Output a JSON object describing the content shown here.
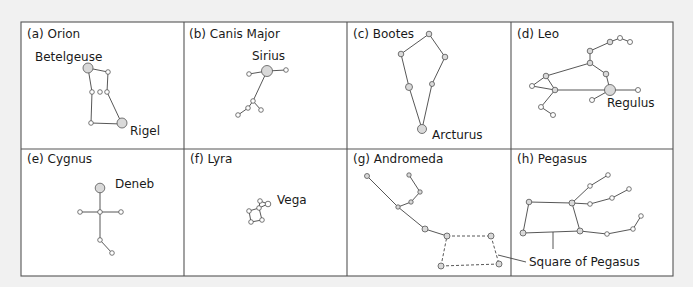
{
  "figure": {
    "panels": [
      {
        "id": "a",
        "title": "(a) Orion",
        "star_labels": [
          "Betelgeuse",
          "Rigel"
        ]
      },
      {
        "id": "b",
        "title": "(b) Canis Major",
        "star_labels": [
          "Sirius"
        ]
      },
      {
        "id": "c",
        "title": "(c) Bootes",
        "star_labels": [
          "Arcturus"
        ]
      },
      {
        "id": "d",
        "title": "(d) Leo",
        "star_labels": [
          "Regulus"
        ]
      },
      {
        "id": "e",
        "title": "(e) Cygnus",
        "star_labels": [
          "Deneb"
        ]
      },
      {
        "id": "f",
        "title": "(f) Lyra",
        "star_labels": [
          "Vega"
        ]
      },
      {
        "id": "g",
        "title": "(g) Andromeda",
        "star_labels": []
      },
      {
        "id": "h",
        "title": "(h) Pegasus",
        "star_labels": [],
        "annotation": "Square of Pegasus"
      }
    ]
  },
  "colors": {
    "background": "#f1f1f1",
    "panel": "#ffffff",
    "bright_star_fill": "#d9d9d9",
    "line": "#444444"
  }
}
